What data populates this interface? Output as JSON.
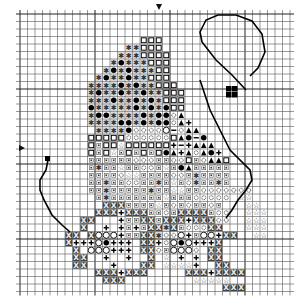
{
  "chart_data": {
    "type": "table",
    "title": "",
    "grid": {
      "cols": 36,
      "rows": 37,
      "origin_x": 20,
      "origin_y": 14,
      "cell": 7.5
    },
    "center_markers": {
      "top_col": 18,
      "left_row": 18
    },
    "legend": {
      "*": "asterisk-gray",
      "O": "filled-circle",
      "s": "open-square",
      "d": "dot-square",
      "c": "small-open-circle",
      "t": "star",
      "A": "filled-triangle",
      "+": "plus",
      "X": "dark-x-box",
      "C": "large-open-circle",
      "-": "minus",
      "B": "black-square",
      ".": "empty"
    },
    "rows": [
      "....................................",
      "....................................",
      "....................................",
      "................sss.................",
      "..............**sss.................",
      ".............***ssss................",
      "............*O***sss................",
      "...........*O*O***ss................",
      "..........*O**O**sss................",
      ".........****O*O**sss...............",
      ".........*O**O**O**sss..............",
      ".........***O**O*O*sss..............",
      ".........O*****O*O*Oss..............",
      ".........*OO****O*OOcA..............",
      ".........****OO*O*OOcA+.............",
      "..........****OccccC-cAA............",
      ".........sssssccccccsAO-O...........",
      ".........sdsstssssss+-+AAA..........",
      ".........sdstdsdsdsOA+AcAO+.........",
      ".........ddddddcccddccsdcAAs.........",
      ".........d*ddtddccdtdOAddddd........",
      ".........ddddcttddddccd*dddd........",
      ".........dd*ddccdd*dtdc*dd*d........",
      ".........dd*ddddd*ddttddccccccc.....",
      "..........d*dddddddtdddccccc.tt.....",
      "...........XXXddddtdcdcddcd...tt....",
      "..........XXX+XXXddcdXXXXdcc..ttt...",
      "........XX...+ddXXdXXX+XXXcc..ttt...",
      "........X..+.+d+dXX*XdcccXX...ttt...",
      "......XX.XCCC+ddXX*ccC+dCC+XX..tt...",
      "......X+++CO+++.XX+cCOC+++X.........",
      ".......X.CCC+++.XXcdCCCc.XX.........",
      ".......XX..+..+..X.t.+.+.XX.........",
      ".......XX...+...XX.tttt+..XX........",
      "..........XXX+XXX.....XXX+XXXX......",
      "...........XXX.........ttttt........",
      "...........................XXX......"
    ],
    "handle_path": "M246,90 L232,75 L216,60 L202,42 L200,32 L206,20 L218,15 L236,15 L252,21 L262,34 L265,52 L258,68 L250,76",
    "spout_path": "M48,160 L46,170 L40,180 L40,190 L44,200 L52,215 L62,225 L70,232",
    "handle_lower_path": "M200,80 L210,110 L230,150 L250,170 L252,180 L246,190 L238,200 L232,210 L226,218",
    "black_squares": [
      [
        226,
        86
      ],
      [
        232,
        86
      ],
      [
        226,
        92
      ],
      [
        232,
        92
      ]
    ],
    "spout_tip_square": [
      45,
      156
    ]
  }
}
